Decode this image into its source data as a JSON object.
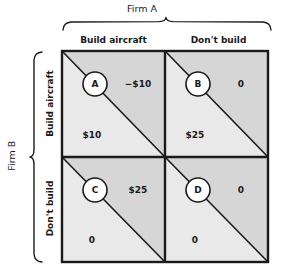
{
  "diagram": {
    "title_top": "Firm A",
    "title_left": "Firm B",
    "columns": [
      "Build aircraft",
      "Don't build"
    ],
    "rows": [
      "Build aircraft",
      "Don't build"
    ],
    "cells": [
      {
        "id": "A",
        "row": "Build aircraft",
        "column": "Build aircraft",
        "upper_right_payoff": "−$10",
        "lower_left_payoff": "$10"
      },
      {
        "id": "B",
        "row": "Build aircraft",
        "column": "Don't build",
        "upper_right_payoff": "0",
        "lower_left_payoff": "$25"
      },
      {
        "id": "C",
        "row": "Don't build",
        "column": "Build aircraft",
        "upper_right_payoff": "$25",
        "lower_left_payoff": "0"
      },
      {
        "id": "D",
        "row": "Don't build",
        "column": "Don't build",
        "upper_right_payoff": "0",
        "lower_left_payoff": "0"
      }
    ],
    "colors": {
      "upper_triangle_fill": "#d6d6d6",
      "lower_triangle_fill": "#e9e9e9",
      "border": "#1a1a1a",
      "text": "#1a1a1a",
      "circle_fill": "#ffffff"
    }
  }
}
